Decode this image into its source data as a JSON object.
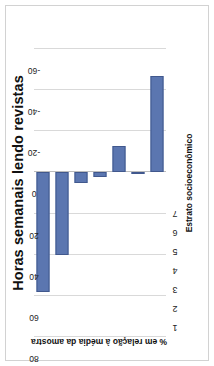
{
  "chart_data": {
    "type": "bar",
    "title": "Horas semanais lendo revistas",
    "xlabel": "Estrato socioeconômico",
    "ylabel": "% em relação à média da amostra",
    "categories": [
      "1",
      "2",
      "3",
      "4",
      "5",
      "6",
      "7"
    ],
    "values": [
      58,
      40,
      5,
      2,
      -13,
      1,
      -47
    ],
    "ylim": [
      -60,
      80
    ],
    "yticks": [
      "80",
      "60",
      "40",
      "20",
      "0",
      "-20",
      "-40",
      "-60"
    ],
    "ytick_values": [
      80,
      60,
      40,
      20,
      0,
      -20,
      -40,
      -60
    ],
    "grid": true,
    "legend": "none",
    "orientation": "rotated-90",
    "series": [
      {
        "name": "% em relação à média da amostra",
        "values": [
          58,
          40,
          5,
          2,
          -13,
          1,
          -47
        ]
      }
    ],
    "bar_color": "#5b76b0",
    "grid_color": "#d9d9d9"
  }
}
